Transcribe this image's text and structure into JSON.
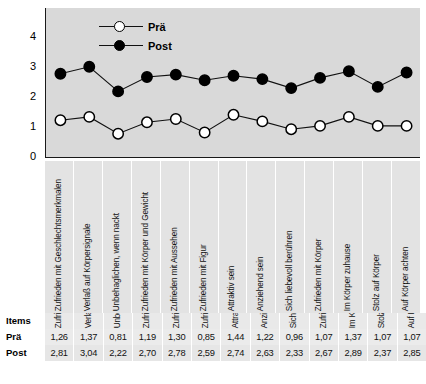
{
  "chart_data": {
    "type": "line",
    "title": "",
    "xlabel": "Items",
    "ylabel": "",
    "ylim": [
      0,
      4
    ],
    "yticks": [
      "4",
      "3",
      "2",
      "1",
      "0"
    ],
    "grid": false,
    "legend_position": "top-center",
    "categories": [
      "Zufrieden mit Geschlechtsmerkmalen",
      "Verlaß auf Körpersignale",
      "Unbehaglichen, wenn nackt",
      "Zufrieden mit Körper und Gewicht",
      "Zufrieden mit Aussehen",
      "Zufrieden mit Figur",
      "Attraktiv sein",
      "Anziehend sein",
      "Sich liebevoll berühren",
      "Zufrieden mit Körper",
      "Im Körper zuhause",
      "Stolz auf Körper",
      "Auf Körper achten"
    ],
    "series": [
      {
        "name": "Prä",
        "marker": "open-circle",
        "color": "#ffffff",
        "values": [
          1.26,
          1.37,
          0.81,
          1.19,
          1.3,
          0.85,
          1.44,
          1.22,
          0.96,
          1.07,
          1.37,
          1.07,
          1.07
        ]
      },
      {
        "name": "Post",
        "marker": "filled-circle",
        "color": "#000000",
        "values": [
          2.81,
          3.04,
          2.22,
          2.7,
          2.78,
          2.59,
          2.74,
          2.63,
          2.33,
          2.67,
          2.89,
          2.37,
          2.85
        ]
      }
    ]
  },
  "legend": {
    "entries": [
      {
        "label": "Prä",
        "marker": "open-circle"
      },
      {
        "label": "Post",
        "marker": "filled-circle"
      }
    ]
  },
  "table": {
    "row_labels": {
      "items": "Items",
      "pra": "Prä",
      "post": "Post"
    },
    "pra_values": [
      "1,26",
      "1,37",
      "0,81",
      "1,19",
      "1,30",
      "0,85",
      "1,44",
      "1,22",
      "0,96",
      "1,07",
      "1,37",
      "1,07",
      "1,07"
    ],
    "post_values": [
      "2,81",
      "3,04",
      "2,22",
      "2,70",
      "2,78",
      "2,59",
      "2,74",
      "2,63",
      "2,33",
      "2,67",
      "2,89",
      "2,37",
      "2,85"
    ]
  },
  "colors": {
    "plot_background": "#d9d9d9",
    "label_band_background": "#e3e3e3",
    "axis": "#1a1a1a",
    "series_post": "#000000",
    "series_pra": "#ffffff"
  }
}
